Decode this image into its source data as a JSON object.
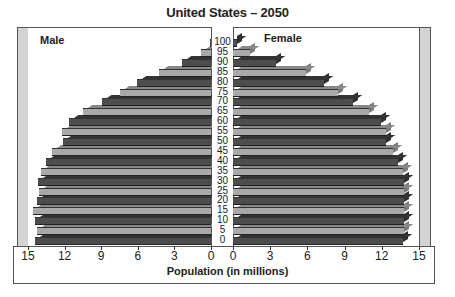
{
  "chart_data": {
    "type": "bar",
    "subtype": "population-pyramid",
    "title": "United States – 2050",
    "xlabel": "Population (in millions)",
    "ylabel": "",
    "categories": [
      "0",
      "5",
      "10",
      "15",
      "20",
      "25",
      "30",
      "35",
      "40",
      "45",
      "50",
      "55",
      "60",
      "65",
      "70",
      "75",
      "80",
      "85",
      "90",
      "95",
      "100"
    ],
    "series": [
      {
        "name": "Male",
        "side": "left",
        "values": [
          14.4,
          14.3,
          14.4,
          14.6,
          14.3,
          14.1,
          14.2,
          13.9,
          13.5,
          13.0,
          12.1,
          12.2,
          11.6,
          10.5,
          8.9,
          7.5,
          6.1,
          4.3,
          2.4,
          0.8,
          0.1
        ]
      },
      {
        "name": "Female",
        "side": "right",
        "values": [
          13.7,
          13.8,
          13.8,
          13.8,
          13.8,
          13.8,
          13.8,
          13.7,
          13.3,
          12.9,
          12.3,
          12.3,
          11.9,
          11.0,
          9.7,
          8.5,
          7.3,
          5.9,
          3.5,
          1.4,
          0.3
        ]
      }
    ],
    "x_ticks_left": [
      "15",
      "12",
      "9",
      "6",
      "3",
      "0"
    ],
    "x_ticks_right": [
      "0",
      "3",
      "6",
      "9",
      "12",
      "15"
    ],
    "xlim": [
      0,
      15
    ],
    "grid": false,
    "legend": {
      "left_label": "Male",
      "right_label": "Female",
      "position": "top-inside"
    },
    "colors": {
      "dark_bar": "#4d4d4d",
      "light_bar": "#a9a9a9",
      "wall": "#d3d3d3"
    }
  }
}
